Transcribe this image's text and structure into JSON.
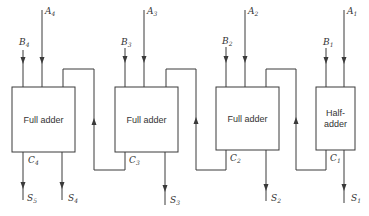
{
  "diagram": {
    "colors": {
      "line": "#3a3a3a",
      "text": "#333333",
      "background": "#ffffff"
    },
    "blocks": [
      {
        "id": "fa4",
        "label_line1": "Full adder",
        "label_line2": "",
        "inputs": [
          "B4",
          "A4"
        ],
        "carry_label": "C4",
        "outputs": [
          "S5",
          "S4"
        ]
      },
      {
        "id": "fa3",
        "label_line1": "Full adder",
        "label_line2": "",
        "inputs": [
          "B3",
          "A3"
        ],
        "carry_label": "C3",
        "outputs": [
          "S3"
        ]
      },
      {
        "id": "fa2",
        "label_line1": "Full adder",
        "label_line2": "",
        "inputs": [
          "B2",
          "A2"
        ],
        "carry_label": "C2",
        "outputs": [
          "S2"
        ]
      },
      {
        "id": "ha1",
        "label_line1": "Half-",
        "label_line2": "adder",
        "inputs": [
          "B1",
          "A1"
        ],
        "carry_label": "C1",
        "outputs": [
          "S1"
        ]
      }
    ],
    "labels": {
      "A4": {
        "main": "A",
        "sub": "4"
      },
      "B4": {
        "main": "B",
        "sub": "4"
      },
      "A3": {
        "main": "A",
        "sub": "3"
      },
      "B3": {
        "main": "B",
        "sub": "3"
      },
      "A2": {
        "main": "A",
        "sub": "2"
      },
      "B2": {
        "main": "B",
        "sub": "2"
      },
      "A1": {
        "main": "A",
        "sub": "1"
      },
      "B1": {
        "main": "B",
        "sub": "1"
      },
      "C4": {
        "main": "C",
        "sub": "4"
      },
      "C3": {
        "main": "C",
        "sub": "3"
      },
      "C2": {
        "main": "C",
        "sub": "2"
      },
      "C1": {
        "main": "C",
        "sub": "1"
      },
      "S5": {
        "main": "S",
        "sub": "5"
      },
      "S4": {
        "main": "S",
        "sub": "4"
      },
      "S3": {
        "main": "S",
        "sub": "3"
      },
      "S2": {
        "main": "S",
        "sub": "2"
      },
      "S1": {
        "main": "S",
        "sub": "1"
      }
    }
  }
}
